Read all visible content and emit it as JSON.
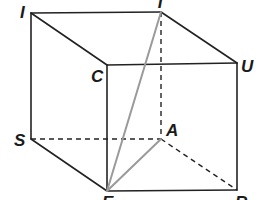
{
  "figure": {
    "type": "cube-perspective",
    "colors": {
      "edge": "#222222",
      "hidden_edge": "#222222",
      "diagonal": "#9a9a9a",
      "background": "#ffffff"
    },
    "vertices": {
      "I": {
        "label": "I",
        "x": 31,
        "y": 13
      },
      "T": {
        "label": "T",
        "x": 161,
        "y": 12
      },
      "C": {
        "label": "C",
        "x": 107,
        "y": 65
      },
      "U": {
        "label": "U",
        "x": 237,
        "y": 63
      },
      "S": {
        "label": "S",
        "x": 31,
        "y": 139
      },
      "A": {
        "label": "A",
        "x": 161,
        "y": 139
      },
      "E": {
        "label": "E",
        "x": 107,
        "y": 191
      },
      "R": {
        "label": "R",
        "x": 237,
        "y": 190
      }
    },
    "visible_edges": [
      [
        "I",
        "T"
      ],
      [
        "I",
        "C"
      ],
      [
        "T",
        "U"
      ],
      [
        "C",
        "U"
      ],
      [
        "I",
        "S"
      ],
      [
        "C",
        "E"
      ],
      [
        "U",
        "R"
      ],
      [
        "S",
        "E"
      ],
      [
        "E",
        "R"
      ]
    ],
    "hidden_edges": [
      [
        "T",
        "A"
      ],
      [
        "S",
        "A"
      ],
      [
        "A",
        "R"
      ]
    ],
    "segments_highlighted": [
      [
        "E",
        "T"
      ],
      [
        "E",
        "A"
      ]
    ]
  }
}
